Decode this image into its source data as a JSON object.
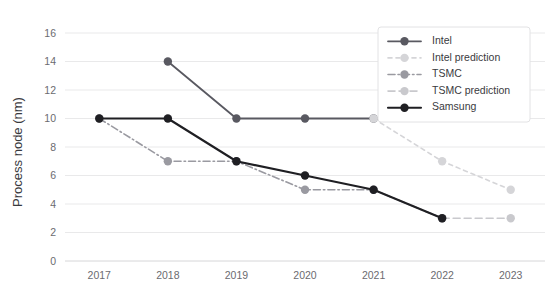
{
  "chart": {
    "type": "line",
    "title": "",
    "xlabel": "",
    "ylabel": "Process node (nm)"
  },
  "chart_data": {
    "type": "line",
    "title": "",
    "xlabel": "",
    "ylabel": "Process node (nm)",
    "x": [
      "2017",
      "2018",
      "2019",
      "2020",
      "2021",
      "2022",
      "2023"
    ],
    "categories": [
      "2017",
      "2018",
      "2019",
      "2020",
      "2021",
      "2022",
      "2023"
    ],
    "xtick_labels": [
      "2017",
      "2018",
      "2019",
      "2020",
      "2021",
      "2022",
      "2023"
    ],
    "ytick_labels": [
      "0",
      "2",
      "4",
      "6",
      "8",
      "10",
      "12",
      "14",
      "16"
    ],
    "ytick_values": [
      0,
      2,
      4,
      6,
      8,
      10,
      12,
      14,
      16
    ],
    "ylim": [
      0,
      16
    ],
    "grid": true,
    "grid_axis": "y",
    "legend_position": "top-right",
    "series": [
      {
        "name": "Intel",
        "color": "#595961",
        "linestyle": "solid",
        "dasharray": "",
        "width": 1.8,
        "marker_size": 4.2,
        "x": [
          "2018",
          "2019",
          "2020",
          "2021"
        ],
        "values": [
          14,
          10,
          10,
          10
        ]
      },
      {
        "name": "Intel prediction",
        "color": "#d5d5d8",
        "linestyle": "dotted",
        "dasharray": "4,4",
        "width": 1.6,
        "marker_size": 4.2,
        "x": [
          "2021",
          "2022",
          "2023"
        ],
        "values": [
          10,
          7,
          5
        ]
      },
      {
        "name": "TSMC",
        "color": "#9a9aa1",
        "linestyle": "dashdot",
        "dasharray": "7,3,1.5,3",
        "width": 1.6,
        "marker_size": 4.2,
        "x": [
          "2017",
          "2018",
          "2019",
          "2020",
          "2021",
          "2022"
        ],
        "values": [
          10,
          7,
          7,
          5,
          5,
          3
        ]
      },
      {
        "name": "TSMC prediction",
        "color": "#c9c9cd",
        "linestyle": "dashed",
        "dasharray": "7,4",
        "width": 1.6,
        "marker_size": 4.2,
        "x": [
          "2022",
          "2023"
        ],
        "values": [
          3,
          3
        ]
      },
      {
        "name": "Samsung",
        "color": "#1f1f23",
        "linestyle": "solid",
        "dasharray": "",
        "width": 2.1,
        "marker_size": 4.2,
        "x": [
          "2017",
          "2018",
          "2019",
          "2020",
          "2021",
          "2022"
        ],
        "values": [
          10,
          10,
          7,
          6,
          5,
          3
        ]
      }
    ],
    "annotations": []
  },
  "legend": {
    "items": [
      {
        "label": "Intel"
      },
      {
        "label": "Intel prediction"
      },
      {
        "label": "TSMC"
      },
      {
        "label": "TSMC prediction"
      },
      {
        "label": "Samsung"
      }
    ]
  }
}
